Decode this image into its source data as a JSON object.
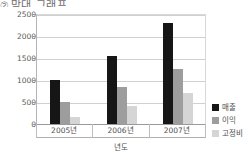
{
  "title": {
    "marker": "②",
    "text": "막대 그래프"
  },
  "axis": {
    "x_title": "년도",
    "y_ticks": [
      "2500",
      "2000",
      "1500",
      "1000",
      "500",
      "0"
    ]
  },
  "legend": {
    "items": [
      {
        "label": "매출",
        "color": "#161616"
      },
      {
        "label": "이익",
        "color": "#9d9d9d"
      },
      {
        "label": "고정비",
        "color": "#d5d5d5"
      }
    ]
  },
  "chart_data": {
    "type": "bar",
    "title": "막대 그래프",
    "xlabel": "년도",
    "ylabel": "",
    "categories": [
      "2005년",
      "2006년",
      "2007년"
    ],
    "series": [
      {
        "name": "매출",
        "color": "#161616",
        "values": [
          1000,
          1550,
          2290
        ]
      },
      {
        "name": "이익",
        "color": "#9d9d9d",
        "values": [
          500,
          850,
          1250
        ]
      },
      {
        "name": "고정비",
        "color": "#d5d5d5",
        "values": [
          150,
          420,
          700
        ]
      }
    ],
    "ylim": [
      0,
      2500
    ],
    "ytick_step": 500,
    "grid": true,
    "legend_position": "right"
  }
}
